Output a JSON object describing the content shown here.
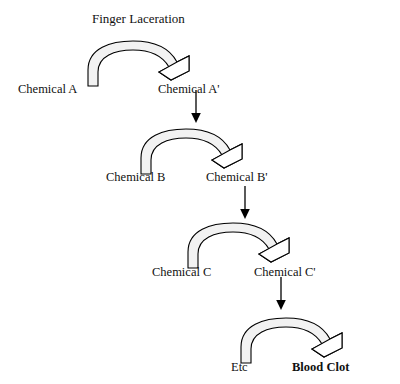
{
  "diagram": {
    "title": "Finger Laceration",
    "type": "cascade-flow",
    "background_color": "#ffffff",
    "stroke_color": "#000000",
    "arc_fill_color": "#f2f2f2",
    "arrowhead_fill_color": "#ffffff",
    "stages": [
      {
        "id": "stage-1",
        "reactant": "Chemical A",
        "product": "Chemical A'",
        "arc_icon": "curved-block-arrow-icon",
        "arc_x": 85,
        "arc_y": 40,
        "arc_w": 120,
        "arc_h": 45,
        "reactant_x": 18,
        "reactant_y": 83,
        "product_x": 158,
        "product_y": 83
      },
      {
        "id": "stage-2",
        "reactant": "Chemical B",
        "product": "Chemical B'",
        "arc_icon": "curved-block-arrow-icon",
        "arc_x": 138,
        "arc_y": 128,
        "arc_w": 120,
        "arc_h": 45,
        "reactant_x": 106,
        "reactant_y": 171,
        "product_x": 206,
        "product_y": 171
      },
      {
        "id": "stage-3",
        "reactant": "Chemical C",
        "product": "Chemical C'",
        "arc_icon": "curved-block-arrow-icon",
        "arc_x": 185,
        "arc_y": 222,
        "arc_w": 120,
        "arc_h": 45,
        "reactant_x": 152,
        "reactant_y": 266,
        "product_x": 254,
        "product_y": 266
      },
      {
        "id": "stage-4",
        "reactant": "Etc",
        "product": "Blood Clot",
        "product_bold": true,
        "arc_icon": "curved-block-arrow-icon",
        "arc_x": 238,
        "arc_y": 317,
        "arc_w": 120,
        "arc_h": 45,
        "reactant_x": 231,
        "reactant_y": 361,
        "product_x": 292,
        "product_y": 361
      }
    ],
    "links": [
      {
        "id": "link-1",
        "icon": "down-arrow-icon",
        "from": "Chemical A'",
        "to": "stage-2",
        "x": 194,
        "y": 90,
        "length": 32
      },
      {
        "id": "link-2",
        "icon": "down-arrow-icon",
        "from": "Chemical B'",
        "to": "stage-3",
        "x": 243,
        "y": 186,
        "length": 32
      },
      {
        "id": "link-3",
        "icon": "down-arrow-icon",
        "from": "Chemical C'",
        "to": "stage-4",
        "x": 279,
        "y": 277,
        "length": 32
      }
    ],
    "title_x": 92,
    "title_y": 12
  }
}
